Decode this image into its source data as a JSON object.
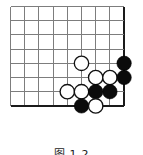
{
  "figure": {
    "kind": "go-board-diagram",
    "caption": "图 1-2",
    "background_color": "#ffffff"
  },
  "board": {
    "columns": 9,
    "rows": 8,
    "spacing": 14.2,
    "origin_x": 10.5,
    "origin_y": 6.5,
    "line_color": "#7d7d7d",
    "edge_color": "#1a1a1a",
    "edge_sides": [
      "right",
      "bottom"
    ],
    "line_width": 1.05,
    "edge_line_width": 2.6
  },
  "stones": {
    "radius": 7.2,
    "black_color": "#0b0b0b",
    "white_color": "#ffffff",
    "white_outline_color": "#111111",
    "items": [
      {
        "name": "white-stone-c5-r4",
        "color": "white",
        "col": 5,
        "row": 4
      },
      {
        "name": "black-stone-c8-r4",
        "color": "black",
        "col": 8,
        "row": 4
      },
      {
        "name": "white-stone-c6-r5",
        "color": "white",
        "col": 6,
        "row": 5
      },
      {
        "name": "white-stone-c7-r5",
        "color": "white",
        "col": 7,
        "row": 5
      },
      {
        "name": "black-stone-c8-r5",
        "color": "black",
        "col": 8,
        "row": 5
      },
      {
        "name": "white-stone-c4-r6",
        "color": "white",
        "col": 4,
        "row": 6
      },
      {
        "name": "white-stone-c5-r6",
        "color": "white",
        "col": 5,
        "row": 6
      },
      {
        "name": "black-stone-c6-r6",
        "color": "black",
        "col": 6,
        "row": 6
      },
      {
        "name": "black-stone-c7-r6",
        "color": "black",
        "col": 7,
        "row": 6
      },
      {
        "name": "black-stone-c5-r7",
        "color": "black",
        "col": 5,
        "row": 7
      },
      {
        "name": "white-stone-c6-r7",
        "color": "white",
        "col": 6,
        "row": 7
      }
    ]
  }
}
